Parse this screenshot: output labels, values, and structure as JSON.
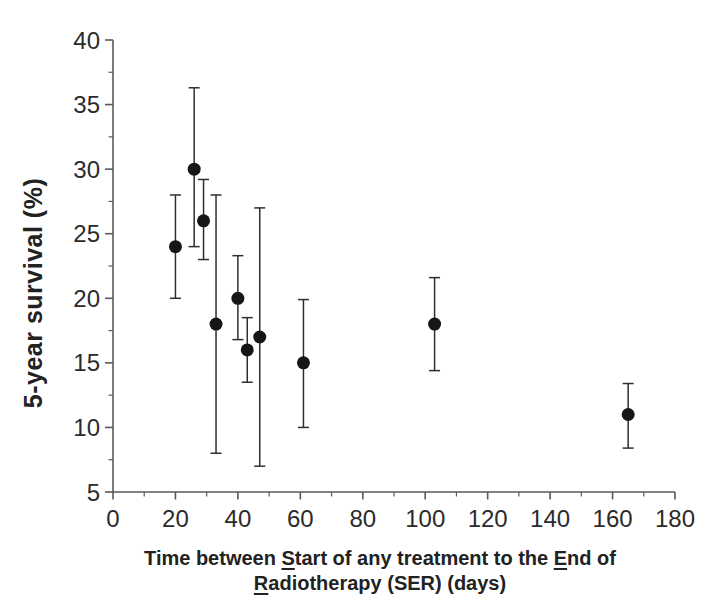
{
  "figure": {
    "background": "#ffffff",
    "ink_color": "#262626",
    "axis_color": "#5a5a5a",
    "marker_color": "#161616"
  },
  "chart_data": {
    "type": "scatter",
    "title": "",
    "ylabel": "5-year survival (%)",
    "xlabel_plain": "Time between Start of any treatment to the End of Radiotherapy (SER) (days)",
    "xlabel_lines": [
      [
        {
          "t": "Time between "
        },
        {
          "t": "S",
          "u": true
        },
        {
          "t": "tart of any treatment to the "
        },
        {
          "t": "E",
          "u": true
        },
        {
          "t": "nd of"
        }
      ],
      [
        {
          "t": "R",
          "u": true
        },
        {
          "t": "adiotherapy (SER) (days)"
        }
      ]
    ],
    "xlim": [
      0,
      180
    ],
    "ylim": [
      5,
      40
    ],
    "x_ticks": [
      0,
      20,
      40,
      60,
      80,
      100,
      120,
      140,
      160,
      180
    ],
    "x_minor_ticks": [
      10,
      30,
      50,
      70,
      90,
      110,
      130,
      150,
      170
    ],
    "y_ticks": [
      5,
      10,
      15,
      20,
      25,
      30,
      35,
      40
    ],
    "y_minor_ticks": [
      7.5,
      12.5,
      17.5,
      22.5,
      27.5,
      32.5,
      37.5
    ],
    "grid": false,
    "legend": null,
    "marker": {
      "shape": "circle",
      "radius_px": 6.5
    },
    "points": [
      {
        "x": 20,
        "y": 24,
        "lo": 20,
        "hi": 28
      },
      {
        "x": 26,
        "y": 30,
        "lo": 24,
        "hi": 36.3
      },
      {
        "x": 29,
        "y": 26,
        "lo": 23,
        "hi": 29.2
      },
      {
        "x": 33,
        "y": 18,
        "lo": 8,
        "hi": 28
      },
      {
        "x": 40,
        "y": 20,
        "lo": 16.8,
        "hi": 23.3
      },
      {
        "x": 43,
        "y": 16,
        "lo": 13.5,
        "hi": 18.5
      },
      {
        "x": 47,
        "y": 17,
        "lo": 7,
        "hi": 27
      },
      {
        "x": 61,
        "y": 15,
        "lo": 10,
        "hi": 19.9
      },
      {
        "x": 103,
        "y": 18,
        "lo": 14.4,
        "hi": 21.6
      },
      {
        "x": 165,
        "y": 11,
        "lo": 8.4,
        "hi": 13.4
      }
    ]
  }
}
